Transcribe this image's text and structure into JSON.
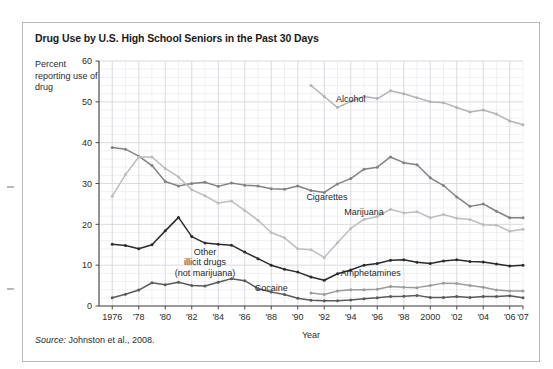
{
  "figure": {
    "title": "Drug Use by U.S. High School Seniors in the Past 30 Days",
    "y_axis_caption": "Percent reporting use of drug",
    "source_prefix": "Source:",
    "source_text": " Johnston et al., 2008."
  },
  "colors": {
    "frame_border": "#b9b9b9",
    "grid_minor": "#e8eaef",
    "grid_major": "#d2d6de",
    "axis": "#4a4a4a",
    "alcohol": "#b4b4b4",
    "cigarettes": "#828282",
    "marijuana": "#bdbdbd",
    "other_illicit": "#2b2b2b",
    "cocaine": "#5a5a5a",
    "amphetamines": "#9b9b9b",
    "text": "#2b2b2b"
  },
  "chart_data": {
    "type": "line",
    "title": "Drug Use by U.S. High School Seniors in the Past 30 Days",
    "xlabel": "Year",
    "ylabel": "Percent reporting use of drug",
    "xlim": [
      1975,
      2007
    ],
    "ylim": [
      0,
      60
    ],
    "ytick_values": [
      0,
      10,
      20,
      30,
      40,
      50,
      60
    ],
    "ytick_labels": [
      "0",
      "10",
      "20",
      "30",
      "40",
      "50",
      "60"
    ],
    "y_minor_step": 2,
    "xtick_values": [
      1976,
      1978,
      1980,
      1982,
      1984,
      1986,
      1988,
      1990,
      1992,
      1994,
      1996,
      1998,
      2000,
      2002,
      2004,
      2006,
      2007
    ],
    "xtick_labels": [
      "1976",
      "'78",
      "'80",
      "'82",
      "'84",
      "'86",
      "'88",
      "'90",
      "'92",
      "'94",
      "'96",
      "'98",
      "2000",
      "'02",
      "'04",
      "'06",
      "'07"
    ],
    "x_minor_step": 1,
    "grid": true,
    "legend_position": "inline-labels",
    "series": [
      {
        "name": "Alcohol",
        "color": "#b4b4b4",
        "label_x": 1994.0,
        "label_y": 50.0,
        "x": [
          1991,
          1992,
          1993,
          1994,
          1995,
          1996,
          1997,
          1998,
          1999,
          2000,
          2001,
          2002,
          2003,
          2004,
          2005,
          2006,
          2007
        ],
        "y": [
          54.0,
          51.3,
          48.6,
          50.1,
          51.3,
          50.8,
          52.7,
          52.0,
          51.0,
          50.0,
          49.8,
          48.6,
          47.5,
          48.0,
          47.0,
          45.3,
          44.4
        ]
      },
      {
        "name": "Cigarettes",
        "color": "#828282",
        "label_x": 1992.2,
        "label_y": 26.0,
        "x": [
          1976,
          1977,
          1978,
          1979,
          1980,
          1981,
          1982,
          1983,
          1984,
          1985,
          1986,
          1987,
          1988,
          1989,
          1990,
          1991,
          1992,
          1993,
          1994,
          1995,
          1996,
          1997,
          1998,
          1999,
          2000,
          2001,
          2002,
          2003,
          2004,
          2005,
          2006,
          2007
        ],
        "y": [
          38.8,
          38.4,
          36.7,
          34.4,
          30.5,
          29.4,
          30.0,
          30.3,
          29.3,
          30.1,
          29.6,
          29.4,
          28.7,
          28.6,
          29.4,
          28.3,
          27.8,
          29.9,
          31.2,
          33.5,
          34.0,
          36.5,
          35.1,
          34.6,
          31.4,
          29.5,
          26.7,
          24.4,
          25.0,
          23.2,
          21.6,
          21.6
        ]
      },
      {
        "name": "Marijuana",
        "color": "#bdbdbd",
        "label_x": 1995.0,
        "label_y": 22.2,
        "x": [
          1976,
          1977,
          1978,
          1979,
          1980,
          1981,
          1982,
          1983,
          1984,
          1985,
          1986,
          1987,
          1988,
          1989,
          1990,
          1991,
          1992,
          1993,
          1994,
          1995,
          1996,
          1997,
          1998,
          1999,
          2000,
          2001,
          2002,
          2003,
          2004,
          2005,
          2006,
          2007
        ],
        "y": [
          26.9,
          32.2,
          36.5,
          36.5,
          33.7,
          31.6,
          28.5,
          27.0,
          25.2,
          25.7,
          23.4,
          21.0,
          18.0,
          16.7,
          14.0,
          13.8,
          11.9,
          15.5,
          19.0,
          21.2,
          21.9,
          23.7,
          22.8,
          23.1,
          21.6,
          22.4,
          21.5,
          21.2,
          19.9,
          19.8,
          18.3,
          18.8
        ]
      },
      {
        "name": "Other illicit drugs (not marijuana)",
        "color": "#2b2b2b",
        "label_lines": [
          "Other",
          "illicit drugs",
          "(not marijuana)"
        ],
        "label_x": 1983.0,
        "label_y": 12.6,
        "x": [
          1976,
          1977,
          1978,
          1979,
          1980,
          1981,
          1982,
          1983,
          1984,
          1985,
          1986,
          1987,
          1988,
          1989,
          1990,
          1991,
          1992,
          1993,
          1994,
          1995,
          1996,
          1997,
          1998,
          1999,
          2000,
          2001,
          2002,
          2003,
          2004,
          2005,
          2006,
          2007
        ],
        "y": [
          15.1,
          14.8,
          14.0,
          15.0,
          18.4,
          21.7,
          17.0,
          15.4,
          15.1,
          14.9,
          13.2,
          11.6,
          10.0,
          9.0,
          8.3,
          7.1,
          6.3,
          7.9,
          8.8,
          10.0,
          10.4,
          11.2,
          11.3,
          10.7,
          10.4,
          11.0,
          11.3,
          10.9,
          10.8,
          10.3,
          9.8,
          10.0
        ]
      },
      {
        "name": "Amphetamines",
        "color": "#9b9b9b",
        "label_x": 1995.5,
        "label_y": 7.3,
        "x": [
          1991,
          1992,
          1993,
          1994,
          1995,
          1996,
          1997,
          1998,
          1999,
          2000,
          2001,
          2002,
          2003,
          2004,
          2005,
          2006,
          2007
        ],
        "y": [
          3.2,
          2.8,
          3.7,
          4.0,
          4.0,
          4.1,
          4.8,
          4.6,
          4.5,
          5.0,
          5.6,
          5.5,
          5.0,
          4.6,
          3.9,
          3.7,
          3.7
        ]
      },
      {
        "name": "Cocaine",
        "color": "#5a5a5a",
        "label_x": 1988.0,
        "label_y": 3.6,
        "x": [
          1976,
          1977,
          1978,
          1979,
          1980,
          1981,
          1982,
          1983,
          1984,
          1985,
          1986,
          1987,
          1988,
          1989,
          1990,
          1991,
          1992,
          1993,
          1994,
          1995,
          1996,
          1997,
          1998,
          1999,
          2000,
          2001,
          2002,
          2003,
          2004,
          2005,
          2006,
          2007
        ],
        "y": [
          2.0,
          2.9,
          3.9,
          5.7,
          5.2,
          5.8,
          5.0,
          4.9,
          5.8,
          6.7,
          6.2,
          4.3,
          3.4,
          2.8,
          1.9,
          1.4,
          1.3,
          1.3,
          1.5,
          1.8,
          2.0,
          2.3,
          2.4,
          2.6,
          2.1,
          2.1,
          2.3,
          2.1,
          2.3,
          2.3,
          2.5,
          2.0
        ]
      }
    ]
  }
}
